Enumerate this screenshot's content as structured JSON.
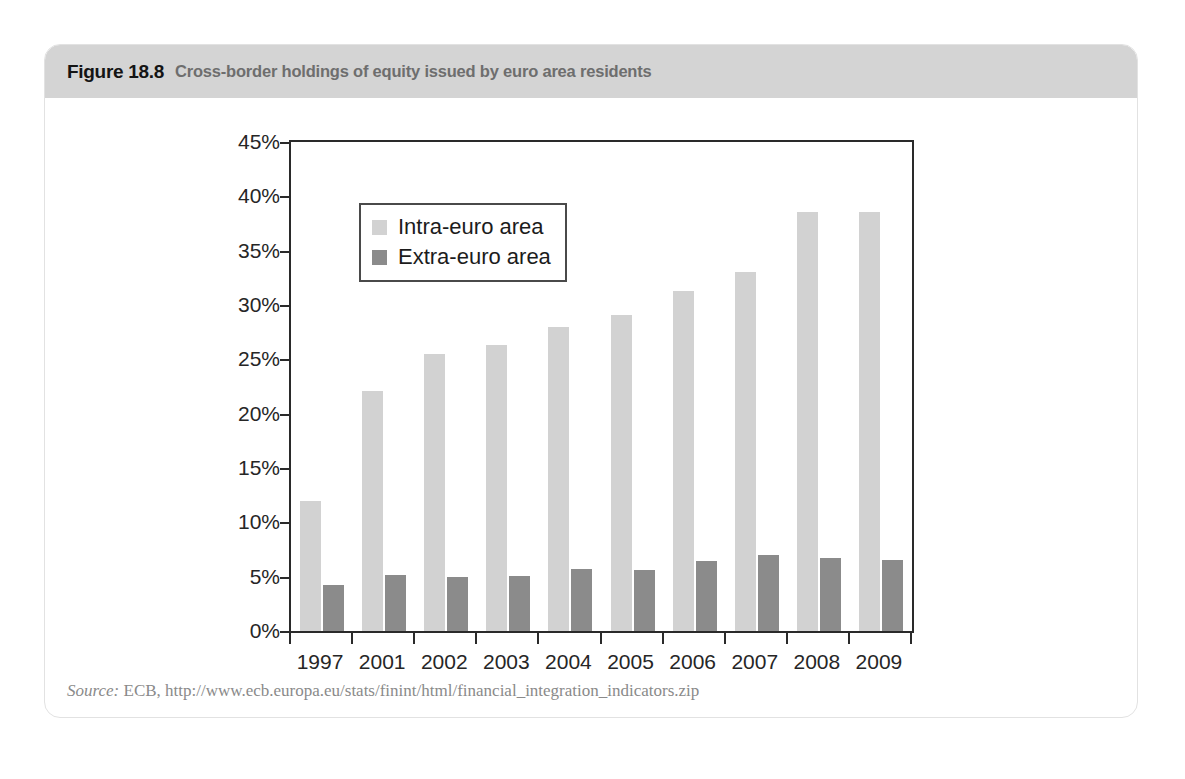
{
  "figure": {
    "number": "Figure 18.8",
    "caption": "Cross-border holdings of equity issued by euro area residents",
    "source_label": "Source:",
    "source_text": "ECB, http://www.ecb.europa.eu/stats/finint/html/financial_integration_indicators.zip"
  },
  "chart_data": {
    "type": "bar",
    "title": "Cross-border holdings of equity issued by euro area residents",
    "xlabel": "",
    "ylabel": "",
    "ylim": [
      0,
      45
    ],
    "ytick_labels": [
      "0%",
      "5%",
      "10%",
      "15%",
      "20%",
      "25%",
      "30%",
      "35%",
      "40%",
      "45%"
    ],
    "ytick_values": [
      0,
      5,
      10,
      15,
      20,
      25,
      30,
      35,
      40,
      45
    ],
    "grid": false,
    "legend_position": "upper-left-inside",
    "categories": [
      "1997",
      "2001",
      "2002",
      "2003",
      "2004",
      "2005",
      "2006",
      "2007",
      "2008",
      "2009"
    ],
    "series": [
      {
        "name": "Intra-euro area",
        "color": "#d2d2d2",
        "values": [
          12.0,
          22.1,
          25.5,
          26.3,
          28.0,
          29.1,
          31.3,
          33.0,
          38.6,
          38.6
        ]
      },
      {
        "name": "Extra-euro area",
        "color": "#8b8b8b",
        "values": [
          4.2,
          5.2,
          5.0,
          5.1,
          5.7,
          5.6,
          6.4,
          7.0,
          6.7,
          6.5
        ]
      }
    ]
  }
}
